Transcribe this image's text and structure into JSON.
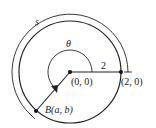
{
  "diagram": {
    "labels": {
      "arc_length": "s",
      "angle": "θ",
      "radius": "2",
      "origin": "(0, 0)",
      "point_start": "(2, 0)",
      "point_b": "B(a, b)"
    },
    "colors": {
      "stroke": "#222222",
      "background": "#ffffff"
    }
  }
}
